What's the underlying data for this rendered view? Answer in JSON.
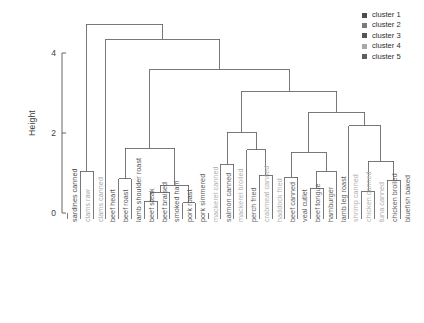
{
  "axis": {
    "ylabel": "Height",
    "ticks": [
      "4",
      "2",
      "0"
    ]
  },
  "legend": {
    "items": [
      {
        "label": "cluster 1",
        "color": "#4d4d4d"
      },
      {
        "label": "cluster 2",
        "color": "#7a7a7a"
      },
      {
        "label": "cluster 3",
        "color": "#555555"
      },
      {
        "label": "cluster 4",
        "color": "#a8a8a8"
      },
      {
        "label": "cluster 5",
        "color": "#5e5e5e"
      }
    ]
  },
  "chart_data": {
    "type": "dendrogram",
    "title": "",
    "xlabel": "",
    "ylabel": "Height",
    "ylim": [
      0,
      5.0
    ],
    "yticks": [
      0,
      2,
      4
    ],
    "grid": false,
    "legend_position": "top-right",
    "n_leaves": 27,
    "leaves": [
      {
        "label": "sardines canned",
        "cluster": 1,
        "color": "#4d4d4d"
      },
      {
        "label": "clams raw",
        "cluster": 2,
        "color": "#a9a9a9"
      },
      {
        "label": "clams canned",
        "cluster": 2,
        "color": "#a9a9a9"
      },
      {
        "label": "beef heart",
        "cluster": 3,
        "color": "#555555"
      },
      {
        "label": "beef roast",
        "cluster": 3,
        "color": "#555555"
      },
      {
        "label": "lamb shoulder roast",
        "cluster": 3,
        "color": "#555555"
      },
      {
        "label": "beef steak",
        "cluster": 3,
        "color": "#555555"
      },
      {
        "label": "beef braised",
        "cluster": 3,
        "color": "#555555"
      },
      {
        "label": "smoked ham",
        "cluster": 3,
        "color": "#555555"
      },
      {
        "label": "pork roast",
        "cluster": 3,
        "color": "#555555"
      },
      {
        "label": "pork simmered",
        "cluster": 3,
        "color": "#555555"
      },
      {
        "label": "mackerel canned",
        "cluster": 4,
        "color": "#b0b0b0"
      },
      {
        "label": "salmon canned",
        "cluster": 5,
        "color": "#5e5e5e"
      },
      {
        "label": "mackerel broiled",
        "cluster": 4,
        "color": "#b0b0b0"
      },
      {
        "label": "perch fried",
        "cluster": 5,
        "color": "#5e5e5e"
      },
      {
        "label": "crabmeat canned",
        "cluster": 4,
        "color": "#b0b0b0"
      },
      {
        "label": "haddock fried",
        "cluster": 4,
        "color": "#b0b0b0"
      },
      {
        "label": "beef canned",
        "cluster": 5,
        "color": "#5e5e5e"
      },
      {
        "label": "veal cutlet",
        "cluster": 5,
        "color": "#5e5e5e"
      },
      {
        "label": "beef tongue",
        "cluster": 5,
        "color": "#5e5e5e"
      },
      {
        "label": "hamburger",
        "cluster": 5,
        "color": "#5e5e5e"
      },
      {
        "label": "lamb leg roast",
        "cluster": 5,
        "color": "#5e5e5e"
      },
      {
        "label": "shrimp canned",
        "cluster": 4,
        "color": "#b0b0b0"
      },
      {
        "label": "chicken canned",
        "cluster": 4,
        "color": "#b0b0b0"
      },
      {
        "label": "tuna canned",
        "cluster": 4,
        "color": "#b0b0b0"
      },
      {
        "label": "chicken broiled",
        "cluster": 5,
        "color": "#5e5e5e"
      },
      {
        "label": "bluefish baked",
        "cluster": 5,
        "color": "#5e5e5e"
      }
    ],
    "merges": [
      {
        "id": "m1",
        "left": {
          "leaf": 1
        },
        "right": {
          "leaf": 2
        },
        "height": 1.05
      },
      {
        "id": "m2",
        "left": {
          "leaf": 6
        },
        "right": {
          "leaf": 7
        },
        "height": 0.3
      },
      {
        "id": "m3",
        "left": {
          "leaf": 8
        },
        "right": {
          "node": "m2"
        },
        "height": 0.52
      },
      {
        "id": "m4",
        "left": {
          "leaf": 9
        },
        "right": {
          "leaf": 10
        },
        "height": 0.26
      },
      {
        "id": "m5",
        "left": {
          "node": "m3"
        },
        "right": {
          "node": "m4"
        },
        "height": 0.7
      },
      {
        "id": "m6",
        "left": {
          "leaf": 4
        },
        "right": {
          "leaf": 5
        },
        "height": 0.86
      },
      {
        "id": "m7",
        "left": {
          "node": "m6"
        },
        "right": {
          "node": "m5"
        },
        "height": 1.62
      },
      {
        "id": "m8",
        "left": {
          "leaf": 12
        },
        "right": {
          "leaf": 13
        },
        "height": 1.22
      },
      {
        "id": "m9",
        "left": {
          "leaf": 15
        },
        "right": {
          "leaf": 16
        },
        "height": 0.95
      },
      {
        "id": "m10",
        "left": {
          "node": "m9"
        },
        "right": {
          "leaf": 14
        },
        "height": 1.58
      },
      {
        "id": "m11",
        "left": {
          "node": "m8"
        },
        "right": {
          "node": "m10"
        },
        "height": 2.02
      },
      {
        "id": "m12",
        "left": {
          "leaf": 17
        },
        "right": {
          "leaf": 18
        },
        "height": 0.9
      },
      {
        "id": "m13",
        "left": {
          "leaf": 19
        },
        "right": {
          "leaf": 20
        },
        "height": 0.62
      },
      {
        "id": "m14",
        "left": {
          "node": "m13"
        },
        "right": {
          "leaf": 21
        },
        "height": 1.05
      },
      {
        "id": "m15",
        "left": {
          "node": "m12"
        },
        "right": {
          "node": "m14"
        },
        "height": 1.52
      },
      {
        "id": "m16",
        "left": {
          "leaf": 23
        },
        "right": {
          "leaf": 24
        },
        "height": 0.55
      },
      {
        "id": "m17",
        "left": {
          "leaf": 25
        },
        "right": {
          "leaf": 26
        },
        "height": 0.82
      },
      {
        "id": "m18",
        "left": {
          "node": "m16"
        },
        "right": {
          "node": "m17"
        },
        "height": 1.3
      },
      {
        "id": "m19",
        "left": {
          "leaf": 22
        },
        "right": {
          "node": "m18"
        },
        "height": 2.18
      },
      {
        "id": "m20",
        "left": {
          "node": "m15"
        },
        "right": {
          "node": "m19"
        },
        "height": 2.52
      },
      {
        "id": "m21",
        "left": {
          "node": "m11"
        },
        "right": {
          "node": "m20"
        },
        "height": 3.05
      },
      {
        "id": "m22",
        "left": {
          "node": "m7"
        },
        "right": {
          "node": "m21"
        },
        "height": 3.6
      },
      {
        "id": "m23",
        "left": {
          "leaf": 3
        },
        "right": {
          "node": "m22"
        },
        "height": 4.35
      },
      {
        "id": "m24",
        "left": {
          "node": "m1"
        },
        "right": {
          "node": "m23"
        },
        "height": 4.72
      }
    ]
  }
}
